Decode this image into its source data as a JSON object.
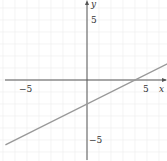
{
  "chart_data": {
    "type": "line",
    "title": "",
    "xlabel": "x",
    "ylabel": "y",
    "xlim": [
      -7.2,
      6.7
    ],
    "ylim": [
      -6.7,
      6.7
    ],
    "grid": true,
    "x_tick_labels": [
      "-5",
      "5"
    ],
    "y_tick_labels": [
      "5",
      "-5"
    ],
    "series": [
      {
        "name": "y = 0.5x - 2",
        "slope": 0.5,
        "intercept": -2,
        "x": [
          -6.8,
          6.7
        ],
        "y": [
          -5.4,
          1.35
        ]
      }
    ]
  },
  "labels": {
    "x_axis": "x",
    "y_axis": "y",
    "x_neg5": "−5",
    "x_pos5": "5",
    "y_pos5": "5",
    "y_neg5": "−5"
  },
  "colors": {
    "axis": "#555555",
    "grid": "#ececec",
    "line": "#999999"
  }
}
